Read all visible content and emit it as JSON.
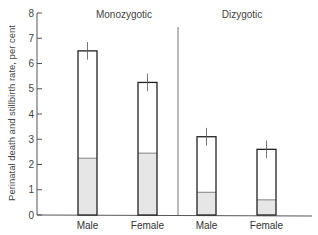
{
  "chart_data": {
    "type": "bar",
    "title": "",
    "xlabel": "",
    "ylabel": "Perinatal death and stillbirth rate, per cent",
    "ylim": [
      0,
      8
    ],
    "yticks": [
      0,
      1,
      2,
      3,
      4,
      5,
      6,
      7,
      8
    ],
    "grid": false,
    "groups": [
      "Monozygotic",
      "Dizygotic"
    ],
    "categories": [
      "Male",
      "Female",
      "Male",
      "Female"
    ],
    "series": [
      {
        "name": "Total rate",
        "values": [
          6.5,
          5.25,
          3.1,
          2.6
        ]
      },
      {
        "name": "Stippled portion",
        "values": [
          2.25,
          2.45,
          0.9,
          0.6
        ]
      },
      {
        "name": "Error bar upper",
        "values": [
          6.85,
          5.6,
          3.45,
          2.95
        ]
      }
    ],
    "bars": [
      {
        "group": "Monozygotic",
        "label": "Male",
        "total": 6.5,
        "stippled": 2.25,
        "err_top": 6.85,
        "err_bottom": 6.15
      },
      {
        "group": "Monozygotic",
        "label": "Female",
        "total": 5.25,
        "stippled": 2.45,
        "err_top": 5.6,
        "err_bottom": 4.9
      },
      {
        "group": "Dizygotic",
        "label": "Male",
        "total": 3.1,
        "stippled": 0.9,
        "err_top": 3.45,
        "err_bottom": 2.75
      },
      {
        "group": "Dizygotic",
        "label": "Female",
        "total": 2.6,
        "stippled": 0.6,
        "err_top": 2.95,
        "err_bottom": 2.25
      }
    ],
    "colors": {
      "bar_outline": "#222222",
      "stipple_fill": "#e6e6e6",
      "axis": "#555555"
    }
  }
}
